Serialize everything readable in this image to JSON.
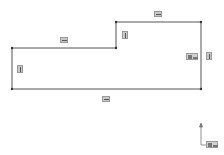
{
  "canvas": {
    "background": "#ffffff",
    "line_color": "#555555",
    "icon_bg": "#c8c8c8"
  },
  "sketch": {
    "points": [
      [
        12,
        89
      ],
      [
        201,
        89
      ],
      [
        201,
        22
      ],
      [
        116,
        22
      ],
      [
        116,
        48
      ],
      [
        12,
        48
      ]
    ],
    "relations": [
      {
        "type": "horizontal",
        "x": 154,
        "y": 11,
        "w": 8,
        "h": 6
      },
      {
        "type": "horizontal",
        "x": 60,
        "y": 37,
        "w": 8,
        "h": 6
      },
      {
        "type": "vertical",
        "x": 122,
        "y": 31,
        "w": 6,
        "h": 8
      },
      {
        "type": "vertical",
        "x": 17,
        "y": 65,
        "w": 6,
        "h": 8
      },
      {
        "type": "vertical",
        "x": 206,
        "y": 52,
        "w": 6,
        "h": 8
      },
      {
        "type": "horizontal",
        "x": 102,
        "y": 96,
        "w": 8,
        "h": 6
      }
    ],
    "dimension_tag": {
      "text": "Ꮁ",
      "x": 186,
      "y": 53
    }
  },
  "origin": {
    "label": "Ꮁ",
    "x": 201,
    "y": 128
  }
}
